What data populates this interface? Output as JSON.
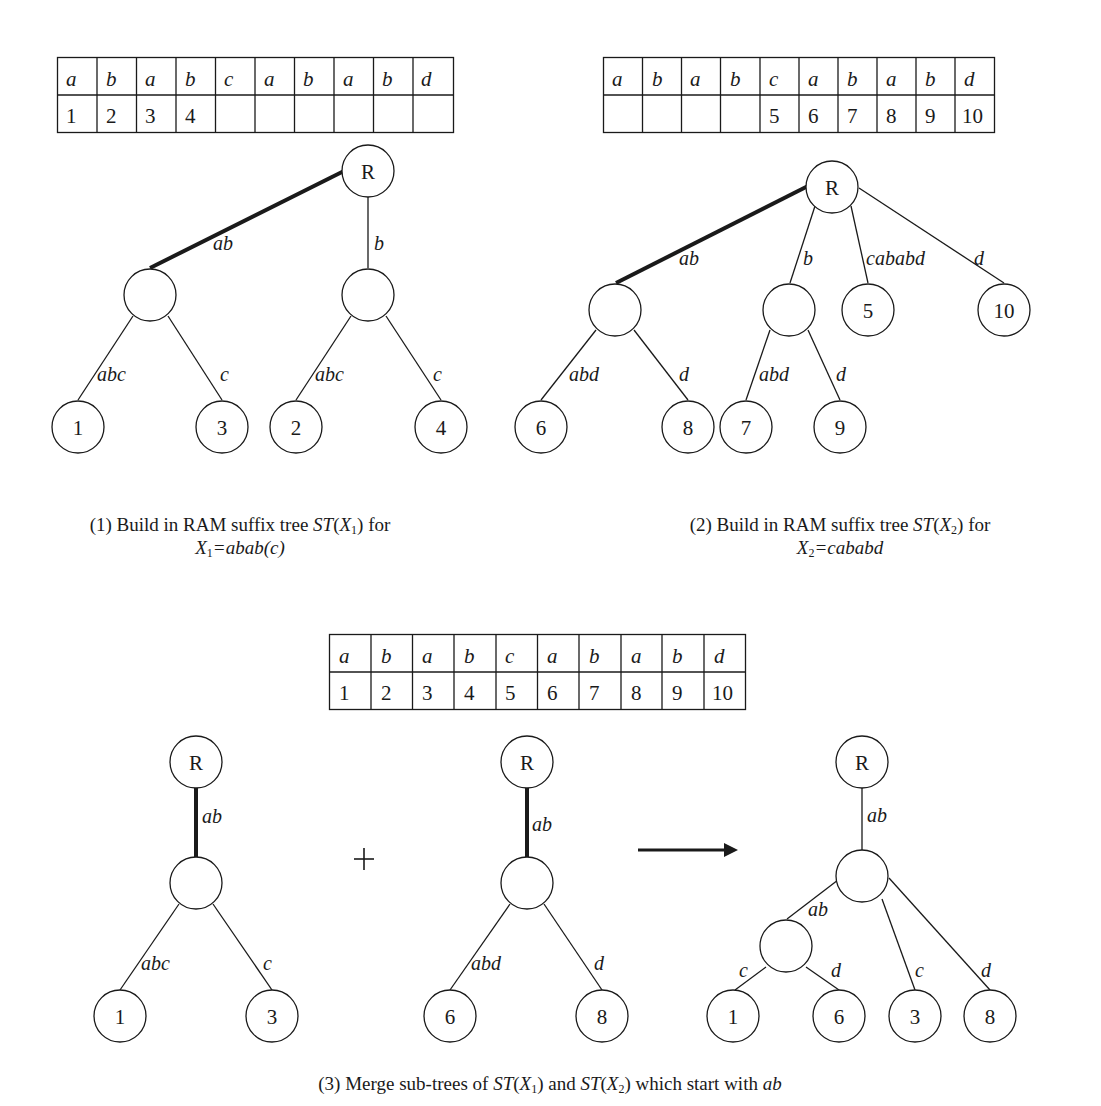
{
  "panel1": {
    "table": {
      "chars": [
        "a",
        "b",
        "a",
        "b",
        "c",
        "a",
        "b",
        "a",
        "b",
        "d"
      ],
      "positions": [
        "1",
        "2",
        "3",
        "4",
        "",
        "",
        "",
        "",
        "",
        ""
      ]
    },
    "root_label": "R",
    "edges": {
      "root_left": "ab",
      "root_right": "b",
      "l_left": "abc",
      "l_right": "c",
      "r_left": "abc",
      "r_right": "c"
    },
    "leaves": [
      "1",
      "3",
      "2",
      "4"
    ],
    "caption": {
      "line1_prefix": "(1) Build in RAM suffix tree ",
      "st": "ST",
      "x": "X",
      "sub": "1",
      "line1_suffix": " for",
      "line2_x": "X",
      "line2_sub": "1",
      "line2_rest": "=abab(c)"
    }
  },
  "panel2": {
    "table": {
      "chars": [
        "a",
        "b",
        "a",
        "b",
        "c",
        "a",
        "b",
        "a",
        "b",
        "d"
      ],
      "positions": [
        "",
        "",
        "",
        "",
        "5",
        "6",
        "7",
        "8",
        "9",
        "10"
      ]
    },
    "root_label": "R",
    "edges": {
      "root_ab": "ab",
      "root_b": "b",
      "root_cababd": "cababd",
      "root_d": "d",
      "ab_left": "abd",
      "ab_right": "d",
      "b_left": "abd",
      "b_right": "d"
    },
    "leaves": [
      "6",
      "8",
      "7",
      "9",
      "5",
      "10"
    ],
    "caption": {
      "line1_prefix": "(2) Build in RAM suffix tree ",
      "st": "ST",
      "x": "X",
      "sub": "2",
      "line1_suffix": " for",
      "line2_x": "X",
      "line2_sub": "2",
      "line2_rest": "=cababd"
    }
  },
  "panel3": {
    "table": {
      "chars": [
        "a",
        "b",
        "a",
        "b",
        "c",
        "a",
        "b",
        "a",
        "b",
        "d"
      ],
      "positions": [
        "1",
        "2",
        "3",
        "4",
        "5",
        "6",
        "7",
        "8",
        "9",
        "10"
      ]
    },
    "tree_x1": {
      "root_label": "R",
      "edge_root": "ab",
      "edge_left": "abc",
      "edge_right": "c",
      "leaves": [
        "1",
        "3"
      ]
    },
    "plus_symbol": "+",
    "tree_x2": {
      "root_label": "R",
      "edge_root": "ab",
      "edge_left": "abd",
      "edge_right": "d",
      "leaves": [
        "6",
        "8"
      ]
    },
    "merged_tree": {
      "root_label": "R",
      "edge_root": "ab",
      "edge_sub": "ab",
      "edge_sub_left": "c",
      "edge_sub_right": "d",
      "edge_c": "c",
      "edge_d": "d",
      "leaves": [
        "1",
        "6",
        "3",
        "8"
      ]
    },
    "caption": {
      "prefix": "(3) Merge sub-trees of ",
      "st1": "ST",
      "x1": "X",
      "sub1": "1",
      "mid": ") and ",
      "st2": "ST",
      "x2": "X",
      "sub2": "2",
      "suffix": ") which start with ",
      "ab": "ab"
    }
  },
  "colors": {
    "ink": "#1a1a1a",
    "background": "#ffffff"
  }
}
